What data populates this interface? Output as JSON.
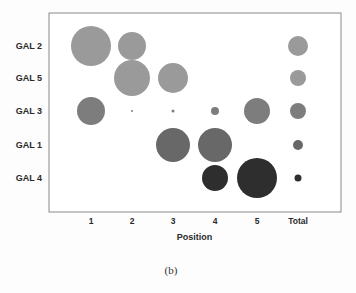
{
  "chart_data": {
    "type": "bubble",
    "title": "",
    "caption": "(b)",
    "xlabel": "Position",
    "ylabel": "",
    "categories": [
      "1",
      "2",
      "3",
      "4",
      "5",
      "Total"
    ],
    "rows": [
      "GAL 2",
      "GAL 5",
      "GAL 3",
      "GAL 1",
      "GAL 4"
    ],
    "grid": false,
    "legend": null,
    "series": [
      {
        "name": "GAL 2",
        "color": "#9a9a9a",
        "sizes": [
          20,
          14,
          0,
          0,
          0,
          10
        ]
      },
      {
        "name": "GAL 5",
        "color": "#9a9a9a",
        "sizes": [
          0,
          18,
          15,
          0,
          0,
          8
        ]
      },
      {
        "name": "GAL 3",
        "color": "#7d7d7d",
        "sizes": [
          14,
          1,
          1.5,
          4,
          13,
          8
        ]
      },
      {
        "name": "GAL 1",
        "color": "#686868",
        "sizes": [
          0,
          0,
          17,
          17,
          0,
          5
        ]
      },
      {
        "name": "GAL 4",
        "color": "#2e2e2e",
        "sizes": [
          0,
          0,
          0,
          13,
          20,
          3.5
        ]
      }
    ],
    "size_units": "relative bubble radius (px)"
  },
  "layout": {
    "frame": {
      "x": 49,
      "y": 13,
      "width": 292,
      "height": 199
    },
    "row_y": [
      46,
      78,
      111,
      145,
      178
    ],
    "col_x": [
      91,
      132,
      173,
      215,
      257,
      298
    ],
    "ylabel_x": 42,
    "xtick_y": 224,
    "xtitle_y": 240,
    "caption_y": 274,
    "caption_x": 171
  }
}
